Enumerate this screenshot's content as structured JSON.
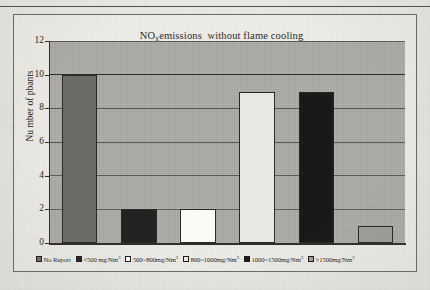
{
  "document": {
    "background_color": "#e8e6e1",
    "has_top_rule": true
  },
  "chart_data": {
    "type": "bar",
    "title_prefix": "NO",
    "title_subscript": "x",
    "title_suffix": "emissions  without flame cooling",
    "xlabel": "",
    "ylabel": "Nu mber of pbants",
    "ylim": [
      0,
      12
    ],
    "ytick_step": 2,
    "yticks": [
      "0",
      "2",
      "4",
      "6",
      "8",
      "10",
      "12"
    ],
    "grid": true,
    "legend_position": "bottom",
    "plot_background": "#adaba6",
    "categories": [
      "No Report",
      "<500 mg/Nm3",
      "500~800mg/Nm3",
      "800~1000mg/Nm3",
      "1000~1500mg/Nm3",
      ">1500mg/Nm3"
    ],
    "values": [
      10,
      2,
      2,
      9,
      9,
      1
    ],
    "bar_colors": [
      "#6d6b67",
      "#232220",
      "#fbfaf7",
      "#e9e7e2",
      "#1a1917",
      "#9e9c97"
    ],
    "series": [
      {
        "name": "Number of plants",
        "values": [
          10,
          2,
          2,
          9,
          9,
          1
        ]
      }
    ]
  },
  "legend": {
    "items": [
      {
        "label_main": "No Report",
        "label_sup": "",
        "swatch": "#6d6b67"
      },
      {
        "label_main": "<500 mg/Nm",
        "label_sup": "3",
        "swatch": "#232220"
      },
      {
        "label_main": "500~800mg/Nm",
        "label_sup": "3",
        "swatch": "#fbfaf7"
      },
      {
        "label_main": "800~1000mg/Nm",
        "label_sup": "3",
        "swatch": "#e9e7e2"
      },
      {
        "label_main": "1000~1500mg/Nm",
        "label_sup": "3",
        "swatch": "#1a1917"
      },
      {
        "label_main": ">1500mg/Nm",
        "label_sup": "3",
        "swatch": "#9e9c97"
      }
    ]
  }
}
